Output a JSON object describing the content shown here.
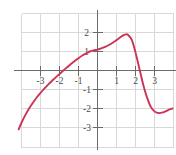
{
  "figure": {
    "title": "",
    "background_color": "#ffffff",
    "grid_color": "#d8d8d8",
    "axis_color": "#6b6b6b",
    "curve_color": "#cc3355",
    "label_color": "#4a4a4a"
  },
  "chart_data": {
    "type": "line",
    "title": "",
    "xlabel": "",
    "ylabel": "",
    "xlim": [
      -4.2,
      4.0
    ],
    "ylim": [
      -3.9,
      2.9
    ],
    "grid": true,
    "grid_spacing": 1,
    "legend": "none",
    "axes": {
      "x_axis_at_y": 0,
      "y_axis_at_x": 0,
      "ticks_shown": true
    },
    "x_tick_values": [
      -3,
      -2,
      -1,
      1,
      2,
      3
    ],
    "x_tick_labels": [
      "-3",
      "-2",
      "-1",
      "1",
      "2",
      "3"
    ],
    "y_tick_values": [
      2,
      1,
      -1,
      -2,
      -3
    ],
    "y_tick_labels": [
      "2",
      "1",
      "-1",
      "-2",
      "-3"
    ],
    "series": [
      {
        "name": "curve",
        "color": "#cc3355",
        "x": [
          -4.15,
          -4.0,
          -3.8,
          -3.6,
          -3.4,
          -3.2,
          -3.0,
          -2.8,
          -2.6,
          -2.4,
          -2.2,
          -2.0,
          -1.8,
          -1.6,
          -1.4,
          -1.2,
          -1.0,
          -0.8,
          -0.6,
          -0.4,
          -0.2,
          0.0,
          0.2,
          0.4,
          0.6,
          0.8,
          1.0,
          1.2,
          1.4,
          1.5,
          1.6,
          1.8,
          2.0,
          2.2,
          2.4,
          2.6,
          2.8,
          3.0,
          3.2,
          3.4,
          3.6,
          3.8,
          3.95
        ],
        "y": [
          -3.1,
          -2.75,
          -2.35,
          -2.0,
          -1.7,
          -1.42,
          -1.18,
          -0.95,
          -0.74,
          -0.55,
          -0.36,
          -0.18,
          0.0,
          0.17,
          0.34,
          0.5,
          0.65,
          0.79,
          0.9,
          1.0,
          1.06,
          1.1,
          1.16,
          1.24,
          1.34,
          1.46,
          1.6,
          1.75,
          1.87,
          1.9,
          1.88,
          1.62,
          0.95,
          0.12,
          -0.72,
          -1.4,
          -1.9,
          -2.15,
          -2.24,
          -2.22,
          -2.14,
          -2.05,
          -2.0
        ],
        "notable_points": {
          "y_intercept": 1.1,
          "x_intercept_left": -1.8,
          "x_intercept_right": 2.22,
          "local_max": [
            1.5,
            1.9
          ],
          "local_min": [
            3.2,
            -2.24
          ]
        }
      }
    ]
  }
}
